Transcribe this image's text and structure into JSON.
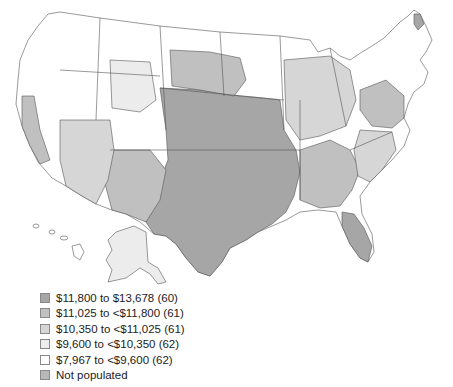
{
  "map": {
    "title": "",
    "region": "United States (contiguous, Alaska, Hawaii) — hospital referral regions",
    "stroke_color": "#555555",
    "background": "#ffffff"
  },
  "legend": {
    "items": [
      {
        "label": "$11,800 to $13,678 (60)",
        "color": "#a6a6a6"
      },
      {
        "label": "$11,025 to <$11,800 (61)",
        "color": "#c0c0c0"
      },
      {
        "label": "$10,350 to <$11,025 (61)",
        "color": "#d6d6d6"
      },
      {
        "label": "$9,600 to <$10,350 (62)",
        "color": "#ececec"
      },
      {
        "label": "$7,967 to <$9,600 (62)",
        "color": "#ffffff"
      },
      {
        "label": "Not populated",
        "color": "#b8b8b8"
      }
    ]
  }
}
